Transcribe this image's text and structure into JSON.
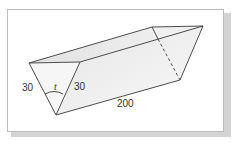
{
  "diagram": {
    "type": "triangular-prism",
    "labels": {
      "left_side": "30",
      "right_side": "30",
      "angle": "t",
      "length": "200"
    },
    "colors": {
      "edge": "#3a3a3a",
      "face_light": "#f4f4f4",
      "face_mid": "#e9e9e9",
      "face_top": "#dedede",
      "frame_border": "#bdbdbd",
      "shadow": "#d4d4d4"
    }
  }
}
